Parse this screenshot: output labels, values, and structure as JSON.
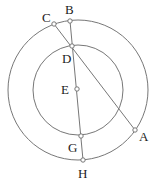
{
  "diagram": {
    "type": "geometry",
    "center": {
      "label": "E",
      "x": 78,
      "y": 90
    },
    "circles": [
      {
        "name": "outer",
        "cx": 78,
        "cy": 90,
        "r": 70
      },
      {
        "name": "inner",
        "cx": 78,
        "cy": 90,
        "r": 45
      }
    ],
    "points": [
      {
        "label": "C",
        "x": 54,
        "y": 24,
        "lx": 42,
        "ly": 22
      },
      {
        "label": "B",
        "x": 70,
        "y": 21,
        "lx": 65,
        "ly": 14
      },
      {
        "label": "D",
        "x": 72,
        "y": 46,
        "lx": 62,
        "ly": 63
      },
      {
        "label": "E",
        "x": 77,
        "y": 89,
        "lx": 61,
        "ly": 94
      },
      {
        "label": "G",
        "x": 81,
        "y": 136,
        "lx": 68,
        "ly": 152
      },
      {
        "label": "H",
        "x": 83,
        "y": 160,
        "lx": 78,
        "ly": 178
      },
      {
        "label": "A",
        "x": 135,
        "y": 130,
        "lx": 139,
        "ly": 141
      }
    ],
    "segments": [
      {
        "from": "C",
        "to": "A"
      },
      {
        "from": "B",
        "to": "H"
      }
    ],
    "stroke_color": "#777777",
    "point_fill": "#ffffff"
  }
}
